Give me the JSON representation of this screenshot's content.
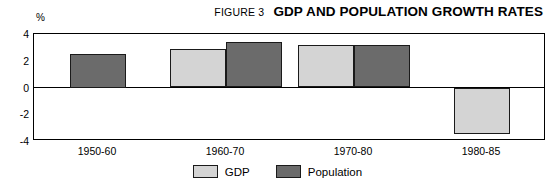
{
  "header": {
    "figure_number": "FIGURE 3",
    "title": "GDP AND POPULATION GROWTH RATES"
  },
  "axis": {
    "unit_label": "%"
  },
  "colors": {
    "gdp": "#d4d4d4",
    "population": "#6b6b6b",
    "axis": "#000000",
    "bar_outline": "#1a1a1a"
  },
  "chart_data": {
    "type": "bar",
    "title": "GDP AND POPULATION GROWTH RATES",
    "subtitle": "FIGURE 3",
    "xlabel": "",
    "ylabel": "%",
    "ylim": [
      -4,
      4
    ],
    "yticks": [
      4,
      2,
      0,
      -2,
      -4
    ],
    "ytick_labels": [
      "4",
      "2",
      "0",
      "-2",
      "-4"
    ],
    "grid": false,
    "zero_line": true,
    "legend_position": "bottom-center",
    "categories": [
      "1950-60",
      "1960-70",
      "1970-80",
      "1980-85"
    ],
    "series": [
      {
        "name": "GDP",
        "color": "#d4d4d4",
        "values": [
          null,
          2.9,
          3.2,
          -3.5
        ]
      },
      {
        "name": "Population",
        "color": "#6b6b6b",
        "values": [
          2.5,
          3.4,
          3.2,
          null
        ]
      }
    ]
  }
}
